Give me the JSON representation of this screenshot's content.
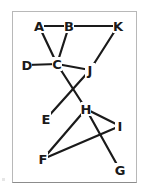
{
  "diagram": {
    "type": "graph",
    "colors": {
      "edge": "#1a1a1a",
      "label": "#1a1a1a",
      "frame": "#b8b8b8",
      "background": "#ffffff"
    },
    "nodes": [
      {
        "id": "A",
        "label": "A",
        "x": 39,
        "y": 26
      },
      {
        "id": "B",
        "label": "B",
        "x": 69,
        "y": 26
      },
      {
        "id": "K",
        "label": "K",
        "x": 118,
        "y": 26
      },
      {
        "id": "D",
        "label": "D",
        "x": 27,
        "y": 65
      },
      {
        "id": "C",
        "label": "C",
        "x": 57,
        "y": 64
      },
      {
        "id": "J",
        "label": "J",
        "x": 90,
        "y": 70
      },
      {
        "id": "E",
        "label": "E",
        "x": 46,
        "y": 119
      },
      {
        "id": "H",
        "label": "H",
        "x": 86,
        "y": 109
      },
      {
        "id": "I",
        "label": "I",
        "x": 120,
        "y": 126
      },
      {
        "id": "F",
        "label": "F",
        "x": 43,
        "y": 159
      },
      {
        "id": "G",
        "label": "G",
        "x": 120,
        "y": 170
      }
    ],
    "edges": [
      [
        "A",
        "B"
      ],
      [
        "B",
        "K"
      ],
      [
        "A",
        "C"
      ],
      [
        "B",
        "C"
      ],
      [
        "D",
        "C"
      ],
      [
        "C",
        "J"
      ],
      [
        "K",
        "J"
      ],
      [
        "C",
        "H"
      ],
      [
        "J",
        "E"
      ],
      [
        "H",
        "I"
      ],
      [
        "H",
        "F"
      ],
      [
        "F",
        "I"
      ],
      [
        "H",
        "G"
      ]
    ]
  }
}
